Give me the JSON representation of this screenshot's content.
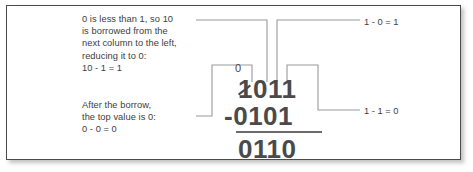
{
  "figure": {
    "frame_color": "#4b4b4b",
    "background": "#ffffff",
    "text_color": "#3d3d3d",
    "digit_color": "#4a4a4a",
    "leader_color": "#9a9a9a"
  },
  "annotations": {
    "top_left": "0 is less than 1, so 10\nis borrowed from the\nnext column to the left,\nreducing it to 0:\n10 - 1 = 1",
    "bottom_left": "After the borrow,\nthe top value is 0:\n0 - 0 = 0",
    "top_right": "1 - 0 = 1",
    "bottom_right": "1 - 1 = 0"
  },
  "calculation": {
    "borrow_mark": "0",
    "minuend_struck_digit": "1",
    "minuend_rest": "011",
    "minuend_full": "1011",
    "operator": "-",
    "subtrahend": "0101",
    "result": "0110"
  }
}
